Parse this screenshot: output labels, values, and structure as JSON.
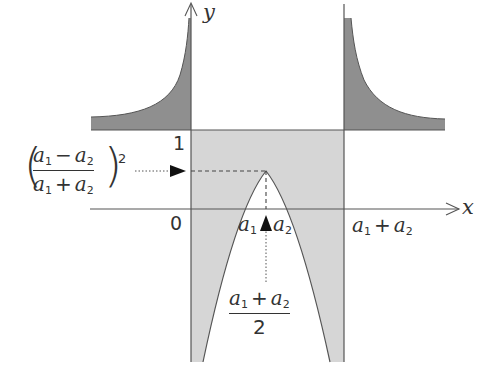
{
  "diagram": {
    "type": "function-graph",
    "axes": {
      "x_label": "x",
      "y_label": "y",
      "origin_label": "0"
    },
    "labels": {
      "y_one": "1",
      "x_a1": "a",
      "x_a1_sub": "1",
      "x_a2": "a",
      "x_a2_sub": "2",
      "x_sum_a": "a",
      "x_sum_a_sub": "1",
      "x_sum_plus": "+",
      "x_sum_b": "a",
      "x_sum_b_sub": "2",
      "left_expr": {
        "num_a": "a",
        "num_a_sub": "1",
        "num_op": "−",
        "num_b": "a",
        "num_b_sub": "2",
        "den_a": "a",
        "den_a_sub": "1",
        "den_op": "+",
        "den_b": "a",
        "den_b_sub": "2",
        "exponent": "2",
        "open_paren": "(",
        "close_paren": ")"
      },
      "mid_expr": {
        "num_a": "a",
        "num_a_sub": "1",
        "num_op": "+",
        "num_b": "a",
        "num_b_sub": "2",
        "den": "2"
      }
    },
    "colors": {
      "dark_fill": "#8f8f8f",
      "light_fill": "#d6d6d6",
      "line": "#555555",
      "text": "#333333",
      "background": "#ffffff"
    }
  }
}
